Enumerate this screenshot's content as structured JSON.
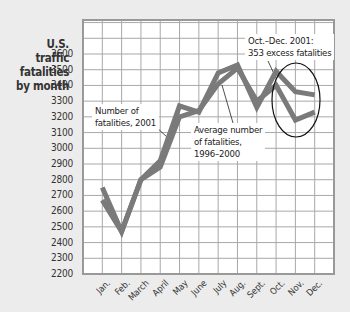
{
  "chart_data": {
    "type": "line",
    "title": "",
    "ylabel": "U.S. traffic fatalities by month",
    "xlabel": "",
    "categories": [
      "Jan.",
      "Feb.",
      "March",
      "April",
      "May",
      "June",
      "July",
      "Aug.",
      "Sept.",
      "Oct.",
      "Nov.",
      "Dec."
    ],
    "series": [
      {
        "name": "Number of fatalities, 2001",
        "values": [
          2750,
          2470,
          2800,
          2920,
          3270,
          3230,
          3480,
          3530,
          3260,
          3490,
          3360,
          3340
        ]
      },
      {
        "name": "Average number of fatalities, 1996–2000",
        "values": [
          2670,
          2470,
          2800,
          2880,
          3200,
          3240,
          3410,
          3510,
          3300,
          3400,
          3180,
          3230
        ]
      }
    ],
    "ylim": [
      2200,
      3600
    ],
    "yticks": [
      3600,
      3500,
      3400,
      3300,
      3200,
      3100,
      3000,
      2900,
      2800,
      2700,
      2600,
      2500,
      2400,
      2300,
      2200
    ],
    "grid": true,
    "legend": "inline annotations",
    "annotations": [
      {
        "text": "Number of fatalities, 2001"
      },
      {
        "text": "Average number of fatalities, 1996–2000"
      },
      {
        "text": "Oct.–Dec. 2001: 353 excess fatalities",
        "highlight": "ellipse around Oct.–Dec."
      }
    ],
    "colors": {
      "line": "#7a7a7a",
      "grid": "#a8a8a8",
      "background": "#ffffff",
      "page": "#ececec"
    }
  },
  "labels": {
    "y_title": [
      "U.S.",
      "traffic",
      "fatalities",
      "by month"
    ],
    "note_2001": [
      "Number of",
      "fatalities, 2001"
    ],
    "note_avg": [
      "Average number",
      "of fatalities,",
      "1996–2000"
    ],
    "note_excess": [
      "Oct.–Dec. 2001:",
      "353 excess fatalities"
    ]
  }
}
